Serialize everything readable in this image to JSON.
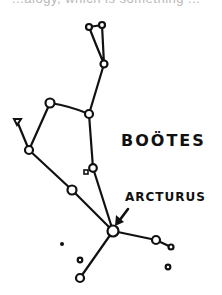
{
  "caption_fragment": "...alogy, which is something ...",
  "diagram": {
    "constellation": "BOÖTES",
    "highlighted_star": "ARCTURUS",
    "line_color": "#111111",
    "background": "#ffffff"
  }
}
